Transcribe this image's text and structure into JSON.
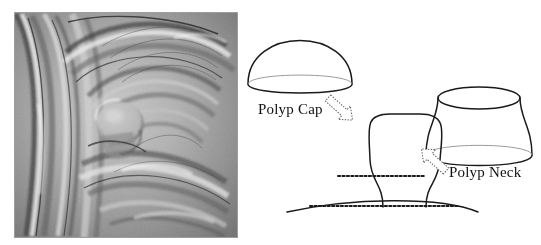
{
  "figure": {
    "kind": "two-panel scientific figure",
    "panels": [
      {
        "name": "endoscopic-rendering",
        "description": "Grayscale 3D virtual-colonoscopy rendering of colon lumen with haustral folds and a protruding polyp"
      },
      {
        "name": "polyp-schematic",
        "description": "Line diagram decomposing a polyp into a cap (dome) and a neck (hyperboloid)"
      }
    ]
  },
  "diagram": {
    "labels": {
      "polyp_cap": "Polyp Cap",
      "polyp_neck": "Polyp Neck"
    },
    "shapes": {
      "cap": {
        "name": "dome",
        "cx": 300,
        "cy": 84,
        "rx": 52,
        "ry": 57,
        "base_ellipse_ry": 11
      },
      "neck": {
        "name": "hyperboloid",
        "cx": 479,
        "top_y": 98,
        "bottom_y": 155,
        "rx_end": 41,
        "rx_waist": 27,
        "ellipse_ry": 11
      },
      "polyp": {
        "name": "composite-polyp",
        "apex_y": 114,
        "base_y": 207,
        "cap_half_width": 38,
        "waist_half_width": 28
      }
    },
    "guides": {
      "upper_dotted_line": {
        "y": 176,
        "x1": 338,
        "x2": 426
      },
      "lower_dotted_line": {
        "y": 206,
        "x1": 310,
        "x2": 458
      },
      "ground_curve": {
        "x1": 287,
        "x2": 478,
        "y": 212
      }
    },
    "arrows": [
      {
        "name": "arrow-to-cap",
        "from": [
          330,
          100
        ],
        "to": [
          357,
          122
        ]
      },
      {
        "name": "arrow-to-neck",
        "from": [
          448,
          164
        ],
        "to": [
          421,
          186
        ]
      }
    ],
    "colors": {
      "stroke": "#1a1a1a",
      "faint_stroke": "#9a9a9a",
      "text": "#111111",
      "background": "#ffffff"
    }
  },
  "endoscopy": {
    "colors": {
      "mid_gray": "#9a9a9a",
      "light_gray": "#d8d8d8",
      "dark_gray": "#4a4a4a",
      "highlight": "#f2f2f2",
      "shadow": "#2e2e2e"
    }
  }
}
